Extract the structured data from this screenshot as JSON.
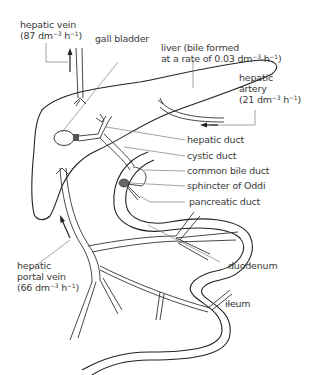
{
  "diagram": {
    "labels": {
      "hepatic_vein": {
        "name": "hepatic vein",
        "rate": "(87 dm",
        "exp": "−3",
        "unit_h": " h",
        "exp2": "−1",
        "close": ")"
      },
      "gall_bladder": {
        "name": "gall bladder"
      },
      "liver": {
        "line1": "liver (bile formed",
        "line2": "at a rate of 0.03 dm",
        "exp": "−3",
        "unit_h": " h",
        "exp2": "−1",
        "close": ")"
      },
      "hepatic_artery": {
        "line1": "hepatic",
        "line2": "artery",
        "rate": "(21 dm",
        "exp": "−3",
        "unit_h": " h",
        "exp2": "−1",
        "close": ")"
      },
      "hepatic_duct": {
        "name": "hepatic duct"
      },
      "cystic_duct": {
        "name": "cystic duct"
      },
      "common_bile_duct": {
        "name": "common bile duct"
      },
      "sphincter_of_oddi": {
        "name": "sphincter of Oddi"
      },
      "pancreatic_duct": {
        "name": "pancreatic duct"
      },
      "duodenum": {
        "name": "duodenum"
      },
      "ileum": {
        "name": "ileum"
      },
      "hepatic_portal_vein": {
        "line1": "hepatic",
        "line2": "portal vein",
        "rate": "(66 dm",
        "exp": "−3",
        "unit_h": " h",
        "exp2": "−1",
        "close": ")"
      }
    },
    "colors": {
      "outline": "#222222",
      "stipple": "#9a9a9a",
      "text": "#3a3a3a"
    }
  }
}
